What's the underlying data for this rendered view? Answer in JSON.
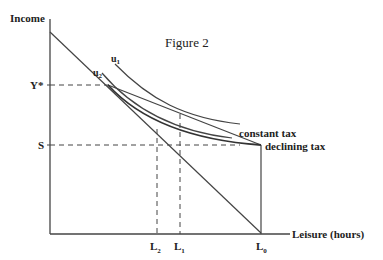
{
  "figure": {
    "title": "Figure 2",
    "y_axis_label": "Income",
    "x_axis_label": "Leisure (hours)",
    "y_ticks": [
      {
        "label": "Y*",
        "y": 85
      },
      {
        "label": "S",
        "y": 145
      }
    ],
    "x_ticks": [
      {
        "label": "L",
        "sub": "2",
        "x": 156
      },
      {
        "label": "L",
        "sub": "1",
        "x": 180
      },
      {
        "label": "L",
        "sub": "0",
        "x": 261
      }
    ],
    "curves": {
      "u1": {
        "label": "u",
        "sub": "1"
      },
      "u2": {
        "label": "u",
        "sub": "2"
      },
      "constant_tax": {
        "label": "constant tax"
      },
      "declining_tax": {
        "label": "declining tax"
      }
    },
    "colors": {
      "ink": "#333333",
      "background": "#ffffff"
    }
  }
}
